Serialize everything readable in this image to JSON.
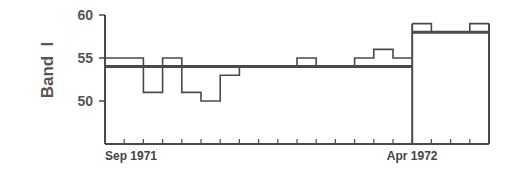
{
  "chart_data": {
    "type": "line",
    "subtype": "step",
    "title": "",
    "ylabel": "Band  I",
    "xlabel": "",
    "ylim": [
      45,
      60
    ],
    "yticks": [
      50,
      55,
      60
    ],
    "xtick_labels": [
      {
        "bin": 0,
        "label": "Sep 1971"
      },
      {
        "bin": 16,
        "label": "Apr 1972"
      }
    ],
    "num_bins": 20,
    "grid": false,
    "series": [
      {
        "name": "observed",
        "values": [
          55,
          55,
          51,
          55,
          51,
          50,
          53,
          54,
          54,
          54,
          55,
          54,
          54,
          55,
          56,
          55,
          59,
          58,
          58,
          59
        ]
      },
      {
        "name": "mean",
        "segments": [
          {
            "from_bin": 0,
            "to_bin": 16,
            "value": 54
          },
          {
            "from_bin": 16,
            "to_bin": 20,
            "value": 58
          }
        ]
      }
    ],
    "annotations": [
      "Vertical divider at Apr 1972 separating periods"
    ]
  },
  "labels": {
    "y_axis_title": "Band  I",
    "y_ticks": [
      "60",
      "55",
      "50"
    ],
    "x_start": "Sep 1971",
    "x_break": "Apr 1972"
  },
  "colors": {
    "line": "#4a4a4a",
    "text": "#555555"
  }
}
